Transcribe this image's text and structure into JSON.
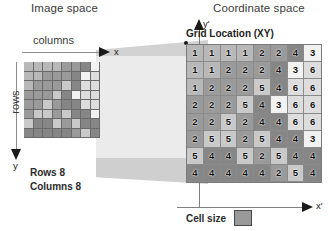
{
  "titles": {
    "image_space": "Image space",
    "coordinate_space": "Coordinate space"
  },
  "image_space": {
    "columns_label": "columns",
    "rows_label": "rows",
    "x_axis_label": "x",
    "y_axis_label": "y",
    "dimensions_rows": "Rows 8",
    "dimensions_columns": "Columns 8"
  },
  "coordinate_space": {
    "grid_title": "Grid Location (XY)",
    "x_axis_label": "x'",
    "y_axis_label": "y'",
    "cell_size_label": "Cell size"
  },
  "chart_data": {
    "type": "heatmap",
    "title": "Grid Location (XY)",
    "xlabel": "x'",
    "ylabel": "y'",
    "rows": 8,
    "columns": 8,
    "values": [
      [
        1,
        1,
        1,
        1,
        2,
        2,
        4,
        3
      ],
      [
        1,
        1,
        2,
        2,
        2,
        4,
        3,
        6
      ],
      [
        1,
        2,
        2,
        2,
        5,
        4,
        6,
        6
      ],
      [
        2,
        2,
        2,
        5,
        4,
        3,
        6,
        6
      ],
      [
        2,
        2,
        5,
        2,
        4,
        4,
        6,
        6
      ],
      [
        2,
        5,
        5,
        2,
        5,
        4,
        4,
        3
      ],
      [
        5,
        4,
        4,
        5,
        2,
        5,
        4,
        4
      ],
      [
        4,
        4,
        4,
        4,
        4,
        2,
        5,
        4
      ]
    ],
    "value_colors": {
      "1": "#b8b8b8",
      "2": "#9a9a9a",
      "3": "#f2f2f2",
      "4": "#868686",
      "5": "#c9c9c9",
      "6": "#dddddd"
    },
    "legend_position": "bottom"
  },
  "colors": {
    "band_light": "#ebebeb",
    "band_dark": "#d2d2d2",
    "axis": "#8d8d8d",
    "ink": "#1a1a1a"
  }
}
